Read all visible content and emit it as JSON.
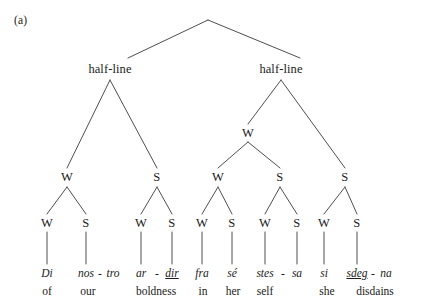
{
  "figure": {
    "label": "(a)",
    "type": "metrical-tree",
    "root_label": "",
    "levels": [
      {
        "name": "line",
        "nodes": [
          {
            "label": "",
            "x": 208,
            "y": 20
          }
        ]
      },
      {
        "name": "half-lines",
        "nodes": [
          {
            "label": "half-line",
            "x": 110,
            "y": 70
          },
          {
            "label": "half-line",
            "x": 281,
            "y": 70
          }
        ]
      },
      {
        "name": "foot-group",
        "nodes": [
          {
            "label": "W",
            "x": 248,
            "y": 133
          }
        ]
      },
      {
        "name": "feet",
        "nodes": [
          {
            "label": "W",
            "x": 67,
            "y": 178
          },
          {
            "label": "S",
            "x": 157,
            "y": 178
          },
          {
            "label": "W",
            "x": 218,
            "y": 178
          },
          {
            "label": "S",
            "x": 280,
            "y": 178
          },
          {
            "label": "S",
            "x": 345,
            "y": 178
          }
        ]
      },
      {
        "name": "syllable-slots",
        "nodes": [
          {
            "label": "W",
            "x": 47,
            "y": 224
          },
          {
            "label": "S",
            "x": 86,
            "y": 224
          },
          {
            "label": "W",
            "x": 141,
            "y": 224
          },
          {
            "label": "S",
            "x": 172,
            "y": 224
          },
          {
            "label": "W",
            "x": 202,
            "y": 224
          },
          {
            "label": "S",
            "x": 232,
            "y": 224
          },
          {
            "label": "W",
            "x": 265,
            "y": 224
          },
          {
            "label": "S",
            "x": 297,
            "y": 224
          },
          {
            "label": "W",
            "x": 324,
            "y": 224
          },
          {
            "label": "S",
            "x": 357,
            "y": 224
          }
        ]
      }
    ],
    "leaves": [
      {
        "syllable": "Di",
        "underline": false,
        "x": 47,
        "hyphen_after": false
      },
      {
        "syllable": "nos",
        "underline": false,
        "x": 86,
        "hyphen_after": true
      },
      {
        "syllable": "tro",
        "underline": false,
        "x": 113,
        "hyphen_after": false
      },
      {
        "syllable": "ar",
        "underline": false,
        "x": 141,
        "hyphen_after": true
      },
      {
        "syllable": "dir",
        "underline": true,
        "x": 172,
        "hyphen_after": false
      },
      {
        "syllable": "fra",
        "underline": false,
        "x": 202,
        "hyphen_after": false
      },
      {
        "syllable": "sé",
        "underline": false,
        "x": 232,
        "hyphen_after": false
      },
      {
        "syllable": "stes",
        "underline": false,
        "x": 265,
        "hyphen_after": true
      },
      {
        "syllable": "sa",
        "underline": false,
        "x": 297,
        "hyphen_after": false
      },
      {
        "syllable": "si",
        "underline": false,
        "x": 324,
        "hyphen_after": false
      },
      {
        "syllable": "sdeg",
        "underline": true,
        "x": 357,
        "hyphen_after": true
      },
      {
        "syllable": "na",
        "underline": false,
        "x": 385,
        "hyphen_after": false
      }
    ],
    "hyphen": "-",
    "glosses": [
      {
        "text": "of",
        "x": 47
      },
      {
        "text": "our",
        "x": 88
      },
      {
        "text": "boldness",
        "x": 156
      },
      {
        "text": "in",
        "x": 203
      },
      {
        "text": "her",
        "x": 233
      },
      {
        "text": "self",
        "x": 265
      },
      {
        "text": "she",
        "x": 327
      },
      {
        "text": "disdains",
        "x": 375
      }
    ],
    "text_rows": {
      "syllable_baseline_y": 277,
      "gloss_baseline_y": 295
    },
    "colors": {
      "ink": "#1a1a1a",
      "line": "#3a3a3a",
      "background": "#ffffff"
    }
  }
}
